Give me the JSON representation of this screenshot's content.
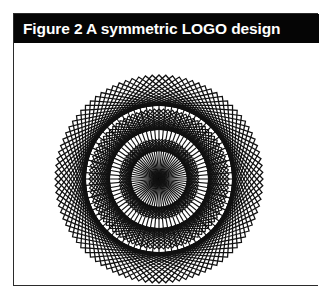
{
  "figure": {
    "caption": "Figure 2 A symmetric LOGO design",
    "frame_border_color": "#2b2b2b",
    "caption_bar_color": "#050505",
    "caption_text_color": "#ffffff",
    "page_background": "#ffffff",
    "ink_color": "#111111"
  },
  "chart_data": {
    "type": "diagram",
    "title": "Figure 2 A symmetric LOGO design",
    "subtitle": "",
    "xlabel": "",
    "ylabel": "",
    "center": {
      "x": 145,
      "y": 136
    },
    "layers": [
      {
        "name": "outer-rotated-squares",
        "shape": "square",
        "count": 24,
        "half_diagonal": 104,
        "rotation_step_deg": 3.75,
        "stroke_width": 1.25,
        "color": "#111111"
      },
      {
        "name": "middle-rotated-squares",
        "shape": "square",
        "count": 24,
        "half_diagonal": 70,
        "rotation_step_deg": 3.75,
        "stroke_width": 1.15,
        "color": "#111111"
      },
      {
        "name": "inner-rotated-squares",
        "shape": "square",
        "count": 20,
        "half_diagonal": 40,
        "rotation_step_deg": 4.5,
        "stroke_width": 1.05,
        "color": "#111111"
      },
      {
        "name": "bounding-circle-ring",
        "shape": "circle",
        "radius": 76,
        "stroke_width": 2.2,
        "color": "#111111"
      },
      {
        "name": "radial-spokes",
        "shape": "line",
        "count": 72,
        "radius": 76,
        "stroke_width": 1.15,
        "color": "#111111"
      }
    ],
    "grid": false,
    "legend": "none"
  }
}
